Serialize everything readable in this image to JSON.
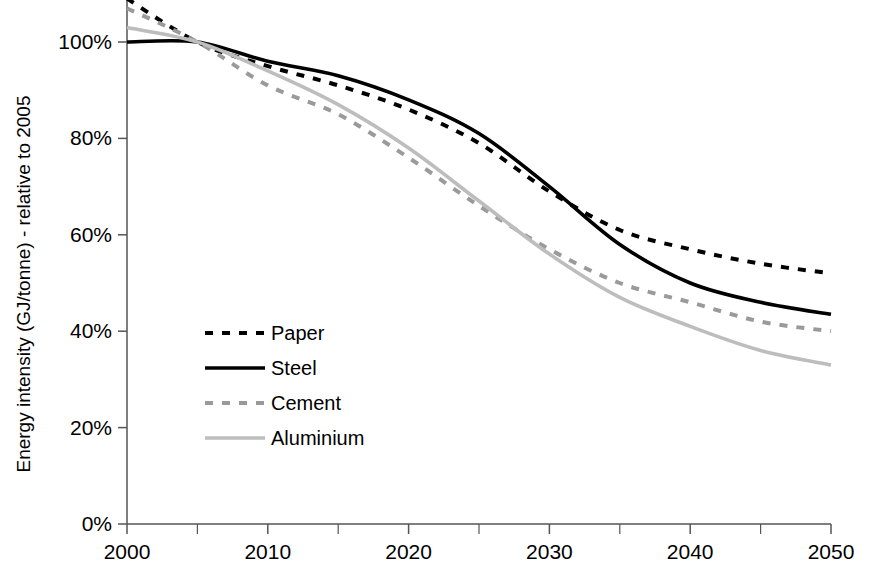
{
  "chart_data": {
    "type": "line",
    "title": "",
    "xlabel": "",
    "ylabel": "Energy intensity (GJ/tonne) - relative to 2005",
    "xlim": [
      2000,
      2050
    ],
    "ylim": [
      0,
      1.1
    ],
    "grid": false,
    "legend_position": "center-left",
    "x_tick_labels": [
      "2000",
      "2010",
      "2020",
      "2030",
      "2040",
      "2050"
    ],
    "x_major_ticks": [
      2000,
      2010,
      2020,
      2030,
      2040,
      2050
    ],
    "x_minor_ticks": [
      2005,
      2015,
      2025,
      2035,
      2045
    ],
    "y_tick_labels": [
      "0%",
      "20%",
      "40%",
      "60%",
      "80%",
      "100%"
    ],
    "y_ticks": [
      0,
      20,
      40,
      60,
      80,
      100
    ],
    "x": [
      2000,
      2005,
      2010,
      2015,
      2020,
      2025,
      2030,
      2035,
      2040,
      2045,
      2050
    ],
    "series": [
      {
        "name": "Paper",
        "color": "#000000",
        "style": "dashed",
        "values": [
          109,
          100,
          95,
          91,
          86,
          79,
          69,
          61,
          57,
          54,
          52
        ]
      },
      {
        "name": "Steel",
        "color": "#000000",
        "style": "solid",
        "values": [
          100,
          100,
          96,
          93,
          88,
          81,
          70,
          58,
          50,
          46,
          43.5
        ]
      },
      {
        "name": "Cement",
        "color": "#9a9a9a",
        "style": "dashed",
        "values": [
          107,
          100,
          91,
          85,
          76,
          66,
          57,
          50,
          46,
          42,
          40
        ]
      },
      {
        "name": "Aluminium",
        "color": "#bdbdbd",
        "style": "solid",
        "values": [
          103,
          100,
          94,
          87,
          78,
          67,
          56,
          47,
          41,
          36,
          33
        ]
      }
    ]
  },
  "legend": {
    "items": [
      {
        "label": "Paper"
      },
      {
        "label": "Steel"
      },
      {
        "label": "Cement"
      },
      {
        "label": "Aluminium"
      }
    ]
  },
  "axes": {
    "y_title": "Energy intensity (GJ/tonne) - relative to 2005"
  }
}
